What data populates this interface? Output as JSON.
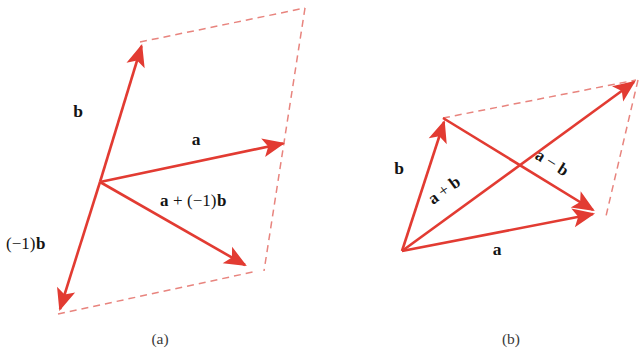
{
  "figure": {
    "type": "vector-diagram",
    "background_color": "#ffffff",
    "solid_vector_color": "#e23b32",
    "dashed_guide_color": "#e8847e",
    "text_color": "#141414",
    "panels": [
      {
        "id": "a",
        "caption": "(a)",
        "labels": {
          "b": "b",
          "a": "a",
          "neg_b": "(−1)b",
          "a_plus_neg_b": "a + (−1)b"
        },
        "label_parts": {
          "neg_b_prefix": "(−1)",
          "neg_b_vector": "b",
          "sum_first": "a",
          "sum_operator": "+",
          "sum_scalar": "(−1)",
          "sum_vector": "b"
        },
        "vectors": [
          {
            "name": "b",
            "from": [
              100,
              182
            ],
            "to": [
              140,
              42
            ],
            "style": "solid",
            "arrow": true
          },
          {
            "name": "a",
            "from": [
              100,
              182
            ],
            "to": [
              287,
              143
            ],
            "style": "solid",
            "arrow": true
          },
          {
            "name": "a + (−1)b",
            "from": [
              100,
              182
            ],
            "to": [
              249,
              268
            ],
            "style": "solid",
            "arrow": true
          },
          {
            "name": "(−1)b",
            "from": [
              100,
              182
            ],
            "to": [
              58,
              314
            ],
            "style": "solid",
            "arrow": true
          }
        ],
        "guides": [
          {
            "from": [
              140,
              42
            ],
            "to": [
              305,
              8
            ],
            "style": "dashed"
          },
          {
            "from": [
              305,
              8
            ],
            "to": [
              264,
              271
            ],
            "style": "dashed"
          },
          {
            "from": [
              58,
              314
            ],
            "to": [
              252,
              272
            ],
            "style": "dashed"
          }
        ]
      },
      {
        "id": "b",
        "caption": "(b)",
        "labels": {
          "b": "b",
          "a": "a",
          "a_plus_b": "a + b",
          "a_minus_b": "a − b"
        },
        "label_parts": {
          "sum_first": "a",
          "sum_operator": "+",
          "sum_second": "b",
          "diff_first": "a",
          "diff_operator": "−",
          "diff_second": "b"
        },
        "vectors": [
          {
            "name": "b",
            "from": [
              402,
              251
            ],
            "to": [
              443,
              118
            ],
            "style": "solid",
            "arrow": true
          },
          {
            "name": "a",
            "from": [
              402,
              251
            ],
            "to": [
              597,
              214
            ],
            "style": "solid",
            "arrow": true
          },
          {
            "name": "a + b",
            "from": [
              402,
              251
            ],
            "to": [
              638,
              79
            ],
            "style": "solid",
            "arrow": true
          },
          {
            "name": "a − b",
            "from": [
              443,
              118
            ],
            "to": [
              597,
              213
            ],
            "style": "solid",
            "arrow": true
          }
        ],
        "guides": [
          {
            "from": [
              443,
              118
            ],
            "to": [
              638,
              79
            ],
            "style": "dashed"
          },
          {
            "from": [
              638,
              79
            ],
            "to": [
              606,
              214
            ],
            "style": "dashed"
          }
        ]
      }
    ]
  }
}
